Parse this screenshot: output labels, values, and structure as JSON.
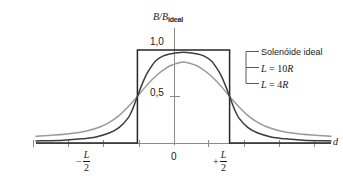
{
  "chart_data": {
    "type": "line",
    "title": "",
    "ylabel": "B/B_ideal",
    "ylabel_main": "B/B",
    "ylabel_sub": "ideal",
    "xlabel": "d",
    "ytick_labels": [
      "0,5",
      "1,0"
    ],
    "ytick_values": [
      0.5,
      1.0
    ],
    "xtick_labels": [
      "−L/2",
      "0",
      "+L/2"
    ],
    "xtick_values": [
      -1,
      0,
      1
    ],
    "xlim": [
      -3.2,
      3.2
    ],
    "ylim": [
      0,
      1.12
    ],
    "grid": false,
    "legend_position": "right",
    "series": [
      {
        "name": "Solenóide ideal",
        "color": "#262626",
        "style": "step",
        "plateau": 1.0,
        "x": [
          -3.2,
          -1.0,
          -1.0,
          1.0,
          1.0,
          3.2
        ],
        "values": [
          0.0,
          0.0,
          1.0,
          1.0,
          0.0,
          0.0
        ]
      },
      {
        "name": "L = 10R",
        "color": "#3c3c3c",
        "style": "smooth",
        "plateau": 0.975,
        "x": [
          -3.2,
          -2.6,
          -2.2,
          -1.9,
          -1.6,
          -1.4,
          -1.2,
          -1.1,
          -1.0,
          -0.9,
          -0.8,
          -0.7,
          -0.6,
          -0.45,
          -0.3,
          0.0,
          0.3,
          0.45,
          0.6,
          0.7,
          0.8,
          0.9,
          1.0,
          1.1,
          1.2,
          1.4,
          1.6,
          1.9,
          2.2,
          2.6,
          3.2
        ],
        "values": [
          0.022,
          0.03,
          0.045,
          0.065,
          0.11,
          0.165,
          0.27,
          0.37,
          0.5,
          0.63,
          0.74,
          0.82,
          0.885,
          0.935,
          0.958,
          0.975,
          0.958,
          0.935,
          0.885,
          0.82,
          0.74,
          0.63,
          0.5,
          0.37,
          0.27,
          0.165,
          0.11,
          0.065,
          0.045,
          0.03,
          0.022
        ]
      },
      {
        "name": "L = 4R",
        "color": "#9a9a9a",
        "style": "smooth",
        "plateau": 0.872,
        "x": [
          -3.2,
          -2.8,
          -2.4,
          -2.1,
          -1.8,
          -1.6,
          -1.4,
          -1.2,
          -1.0,
          -0.85,
          -0.7,
          -0.55,
          -0.4,
          -0.25,
          0.0,
          0.25,
          0.4,
          0.55,
          0.7,
          0.85,
          1.0,
          1.2,
          1.4,
          1.6,
          1.8,
          2.1,
          2.4,
          2.8,
          3.2
        ],
        "values": [
          0.072,
          0.085,
          0.105,
          0.13,
          0.175,
          0.225,
          0.295,
          0.39,
          0.5,
          0.59,
          0.672,
          0.742,
          0.797,
          0.838,
          0.872,
          0.838,
          0.797,
          0.742,
          0.672,
          0.59,
          0.5,
          0.39,
          0.295,
          0.225,
          0.175,
          0.13,
          0.105,
          0.085,
          0.072
        ]
      }
    ],
    "annotations": []
  },
  "axes": {
    "y_title_main": "B/B",
    "y_title_sub": "ideal",
    "y_tick_top": "1,0",
    "y_tick_mid": "0,5",
    "x_tick_origin": "0",
    "x_tick_neg_sign": "−",
    "x_tick_pos_sign": "+",
    "x_tick_numerator": "L",
    "x_tick_denominator": "2",
    "x_axis_name": "d"
  },
  "legend": {
    "ideal_label": "Solenóide ideal",
    "ten_r_var": "L",
    "ten_r_eq": " = 10",
    "ten_r_unit": "R",
    "four_r_var": "L",
    "four_r_eq": " = 4",
    "four_r_unit": "R"
  },
  "colors": {
    "ideal": "#262626",
    "ten_r": "#3c3c3c",
    "four_r": "#9a9a9a",
    "axis": "#7a7a7a",
    "text": "#1a1a1a"
  }
}
